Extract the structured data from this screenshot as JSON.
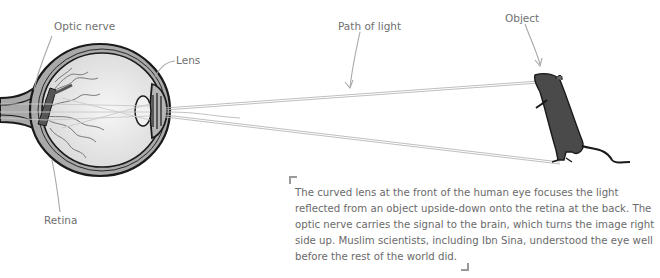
{
  "diagram": {
    "labels": {
      "optic_nerve": "Optic nerve",
      "lens": "Lens",
      "retina": "Retina",
      "path_of_light": "Path of light",
      "object": "Object"
    },
    "caption": "The curved lens at the front of the human eye focuses the light reflected from an object upside-down onto the retina at the back. The optic nerve carries the signal to the brain, which turns the image right side up. Muslim scientists, including Ibn Sina, understood the eye well before the rest of the world did.",
    "colors": {
      "outline": "#1a1a1a",
      "eye_wall": "#a9a9a9",
      "eye_inner": "#e4e4e4",
      "nerve": "#5a5a5a",
      "rat_body": "#4a4a4a",
      "leader_line": "#a8a8a8",
      "text": "#6a6a6a"
    }
  }
}
